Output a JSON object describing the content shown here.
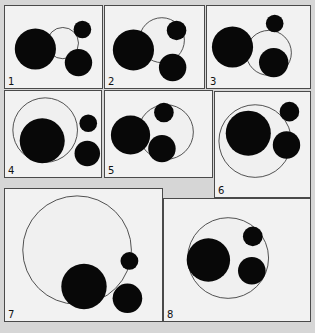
{
  "figure": {
    "canvas_width": 315,
    "canvas_height": 333,
    "background_color": "#d6d6d6",
    "panel_fill": "#f2f2f2",
    "panel_border_color": "#4a4a4a",
    "filled_circle_color": "#080808",
    "outline_circle_stroke": "#3c3c3c",
    "outline_circle_fill": "#f0f0f0"
  },
  "panels": [
    {
      "label": "1",
      "x": 4,
      "y": 5,
      "w": 99,
      "h": 84,
      "circles": [
        {
          "name": "outline-circle",
          "cx": 59,
          "cy": 38,
          "r": 16,
          "style": "outline"
        },
        {
          "name": "large-filled-circle",
          "cx": 31,
          "cy": 44,
          "r": 21,
          "style": "filled"
        },
        {
          "name": "medium-filled-circle",
          "cx": 75,
          "cy": 58,
          "r": 14,
          "style": "filled"
        },
        {
          "name": "small-filled-circle",
          "cx": 79,
          "cy": 24,
          "r": 9,
          "style": "filled"
        }
      ]
    },
    {
      "label": "2",
      "x": 104,
      "y": 5,
      "w": 101,
      "h": 84,
      "circles": [
        {
          "name": "outline-circle",
          "cx": 58,
          "cy": 35,
          "r": 23,
          "style": "outline"
        },
        {
          "name": "large-filled-circle",
          "cx": 29,
          "cy": 45,
          "r": 21,
          "style": "filled"
        },
        {
          "name": "medium-filled-circle",
          "cx": 69,
          "cy": 63,
          "r": 14,
          "style": "filled"
        },
        {
          "name": "small-filled-circle",
          "cx": 73,
          "cy": 25,
          "r": 10,
          "style": "filled"
        }
      ]
    },
    {
      "label": "3",
      "x": 206,
      "y": 5,
      "w": 105,
      "h": 84,
      "circles": [
        {
          "name": "outline-circle",
          "cx": 63,
          "cy": 48,
          "r": 23,
          "style": "outline"
        },
        {
          "name": "large-filled-circle",
          "cx": 26,
          "cy": 42,
          "r": 21,
          "style": "filled"
        },
        {
          "name": "medium-filled-circle",
          "cx": 68,
          "cy": 58,
          "r": 15,
          "style": "filled"
        },
        {
          "name": "small-filled-circle",
          "cx": 69,
          "cy": 18,
          "r": 9,
          "style": "filled"
        }
      ]
    },
    {
      "label": "4",
      "x": 4,
      "y": 90,
      "w": 98,
      "h": 88,
      "circles": [
        {
          "name": "outline-circle",
          "cx": 41,
          "cy": 40,
          "r": 33,
          "style": "outline"
        },
        {
          "name": "large-filled-circle",
          "cx": 38,
          "cy": 51,
          "r": 23,
          "style": "filled"
        },
        {
          "name": "medium-filled-circle",
          "cx": 84,
          "cy": 64,
          "r": 13,
          "style": "filled"
        },
        {
          "name": "small-filled-circle",
          "cx": 85,
          "cy": 33,
          "r": 9,
          "style": "filled"
        }
      ]
    },
    {
      "label": "5",
      "x": 104,
      "y": 90,
      "w": 109,
      "h": 88,
      "circles": [
        {
          "name": "outline-circle",
          "cx": 62,
          "cy": 42,
          "r": 28,
          "style": "outline"
        },
        {
          "name": "large-filled-circle",
          "cx": 26,
          "cy": 45,
          "r": 20,
          "style": "filled"
        },
        {
          "name": "medium-filled-circle",
          "cx": 58,
          "cy": 59,
          "r": 14,
          "style": "filled"
        },
        {
          "name": "small-filled-circle",
          "cx": 60,
          "cy": 22,
          "r": 10,
          "style": "filled"
        }
      ]
    },
    {
      "label": "6",
      "x": 214,
      "y": 91,
      "w": 97,
      "h": 107,
      "circles": [
        {
          "name": "outline-circle",
          "cx": 41,
          "cy": 50,
          "r": 37,
          "style": "outline"
        },
        {
          "name": "large-filled-circle",
          "cx": 34,
          "cy": 42,
          "r": 23,
          "style": "filled"
        },
        {
          "name": "medium-filled-circle",
          "cx": 73,
          "cy": 54,
          "r": 14,
          "style": "filled"
        },
        {
          "name": "small-filled-circle",
          "cx": 76,
          "cy": 20,
          "r": 10,
          "style": "filled"
        }
      ]
    },
    {
      "label": "7",
      "x": 4,
      "y": 188,
      "w": 159,
      "h": 134,
      "circles": [
        {
          "name": "outline-circle",
          "cx": 73,
          "cy": 62,
          "r": 55,
          "style": "outline"
        },
        {
          "name": "large-filled-circle",
          "cx": 80,
          "cy": 99,
          "r": 23,
          "style": "filled"
        },
        {
          "name": "medium-filled-circle",
          "cx": 124,
          "cy": 111,
          "r": 15,
          "style": "filled"
        },
        {
          "name": "small-filled-circle",
          "cx": 126,
          "cy": 73,
          "r": 9,
          "style": "filled"
        }
      ]
    },
    {
      "label": "8",
      "x": 163,
      "y": 198,
      "w": 148,
      "h": 124,
      "circles": [
        {
          "name": "outline-circle",
          "cx": 65,
          "cy": 60,
          "r": 41,
          "style": "outline"
        },
        {
          "name": "large-filled-circle",
          "cx": 45,
          "cy": 62,
          "r": 22,
          "style": "filled"
        },
        {
          "name": "medium-filled-circle",
          "cx": 89,
          "cy": 73,
          "r": 14,
          "style": "filled"
        },
        {
          "name": "small-filled-circle",
          "cx": 90,
          "cy": 38,
          "r": 10,
          "style": "filled"
        }
      ]
    }
  ]
}
